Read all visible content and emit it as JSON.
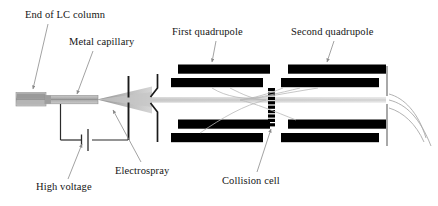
{
  "figure": {
    "background_color": "#ffffff",
    "width": 438,
    "height": 206
  },
  "labels": {
    "lc_column": "End of LC column",
    "metal_capillary": "Metal capillary",
    "first_quadrupole": "First quadrupole",
    "second_quadrupole": "Second quadrupole",
    "high_voltage": "High voltage",
    "electrospray": "Electrospray",
    "collision_cell": "Collision cell"
  },
  "colors": {
    "rod_fill": "#000000",
    "leader_line": "#8a8a8a",
    "spray_cone": "#b9b9b9",
    "ion_beam": "#d8d8d8",
    "capillary_body": "#b0b0b0",
    "capillary_dark": "#8c8c8c",
    "plate_stroke": "#1a1a1a",
    "text": "#151515"
  },
  "components": {
    "lc_column_tip": {
      "name": "end-of-lc-column",
      "x": 16,
      "y": 92,
      "width": 30,
      "height": 16
    },
    "metal_capillary": {
      "name": "metal-capillary",
      "x": 46,
      "y": 95,
      "width": 52,
      "height": 9
    },
    "spray_cone": {
      "name": "electrospray-cone",
      "apex_x": 97,
      "apex_y": 99,
      "end_x": 152,
      "spread": 14
    },
    "counter_electrode": {
      "name": "counter-electrode-plate",
      "x": 128,
      "top": 76,
      "bottom": 140,
      "gap_top": 96,
      "gap_bottom": 103
    },
    "skimmer": {
      "name": "skimmer-cone",
      "x": 152,
      "top": 74,
      "bottom": 142
    },
    "quadrupole_1": {
      "name": "first-quadrupole",
      "rods": [
        {
          "x": 178,
          "y": 65,
          "width": 92,
          "height": 9
        },
        {
          "x": 172,
          "y": 78,
          "width": 92,
          "height": 9
        },
        {
          "x": 178,
          "y": 120,
          "width": 92,
          "height": 9
        },
        {
          "x": 172,
          "y": 133,
          "width": 92,
          "height": 9
        }
      ]
    },
    "collision_cell": {
      "name": "collision-cell",
      "x": 268,
      "top": 88,
      "bottom": 124,
      "segments": 9,
      "width": 7
    },
    "quadrupole_2": {
      "name": "second-quadrupole",
      "rods": [
        {
          "x": 288,
          "y": 65,
          "width": 98,
          "height": 9
        },
        {
          "x": 282,
          "y": 78,
          "width": 98,
          "height": 9
        },
        {
          "x": 288,
          "y": 120,
          "width": 98,
          "height": 9
        },
        {
          "x": 282,
          "y": 133,
          "width": 98,
          "height": 9
        }
      ]
    },
    "detector_plate": {
      "name": "detector-exit-plate",
      "x": 386,
      "top": 66,
      "bottom": 146,
      "gap_top": 96,
      "gap_bottom": 104
    },
    "high_voltage_circuit": {
      "name": "high-voltage-circuit",
      "battery_x": 86,
      "wire_left_x": 60,
      "wire_right_x": 128,
      "wire_bottom_y": 140,
      "wire_top_y": 103
    },
    "ion_beam_axis": {
      "name": "ion-beam-axis",
      "y": 100,
      "x_start": 97,
      "x_end": 386
    }
  },
  "leaders": [
    {
      "name": "leader-lc-column",
      "from": [
        48,
        24
      ],
      "to": [
        33,
        90
      ]
    },
    {
      "name": "leader-metal-capillary",
      "from": [
        92,
        50
      ],
      "to": [
        76,
        95
      ]
    },
    {
      "name": "leader-first-quadrupole",
      "from": [
        214,
        41
      ],
      "to": [
        212,
        63
      ]
    },
    {
      "name": "leader-second-quadrupole",
      "from": [
        332,
        41
      ],
      "to": [
        327,
        63
      ]
    },
    {
      "name": "leader-high-voltage",
      "from": [
        68,
        178
      ],
      "to": [
        82,
        141
      ]
    },
    {
      "name": "leader-electrospray",
      "from": [
        140,
        162
      ],
      "to": [
        112,
        112
      ]
    },
    {
      "name": "leader-collision-cell",
      "from": [
        258,
        172
      ],
      "to": [
        272,
        128
      ]
    }
  ]
}
